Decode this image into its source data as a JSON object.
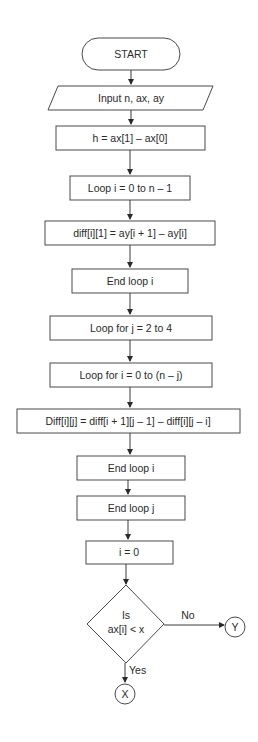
{
  "flowchart": {
    "start": {
      "label": "START"
    },
    "input": {
      "label": "Input n, ax, ay"
    },
    "steps": [
      {
        "label": "h = ax[1] – ax[0]"
      },
      {
        "label": "Loop i = 0 to n – 1"
      },
      {
        "label": "diff[i][1] = ay[i + 1] – ay[i]"
      },
      {
        "label": "End loop i"
      },
      {
        "label": "Loop for j = 2 to 4"
      },
      {
        "label": "Loop for i = 0 to (n – j)"
      },
      {
        "label": "Diff[i][j] = diff[i + 1][j – 1] – diff[i][j – i]"
      },
      {
        "label": "End loop i"
      },
      {
        "label": "End loop j"
      },
      {
        "label": "i = 0"
      }
    ],
    "decision": {
      "line1": "Is",
      "line2": "ax[i] < x"
    },
    "branches": {
      "no": {
        "label": "No",
        "connector": "Y"
      },
      "yes": {
        "label": "Yes",
        "connector": "X"
      }
    }
  }
}
